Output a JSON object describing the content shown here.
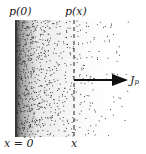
{
  "diagram": {
    "labels": {
      "left_top": "p(0)",
      "mid_top": "p(x)",
      "left_bottom": "x = 0",
      "mid_bottom": "x",
      "flux": "J",
      "flux_sub": "p"
    },
    "region": {
      "x0": 15,
      "x1": 128,
      "y0": 20,
      "y1": 137
    },
    "boundary_x": 15,
    "dashed_line_x": 74,
    "arrow": {
      "x0": 74,
      "x1": 128,
      "y": 80
    },
    "colors": {
      "dots": "#222222",
      "background": "#ffffff",
      "arrow": "#111111"
    }
  }
}
